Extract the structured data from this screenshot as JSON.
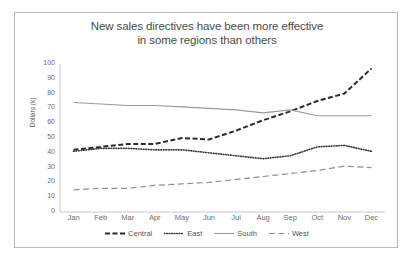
{
  "chart_data": {
    "type": "line",
    "title": "New sales directives have been more effective in some regions than others",
    "title_line1": "New sales directives have been more effective",
    "title_line2": "in some regions than others",
    "xlabel": "",
    "ylabel": "Dollars (k)",
    "ylim": [
      0,
      100
    ],
    "ytick_step": 10,
    "yticks": [
      "100",
      "90",
      "80",
      "70",
      "60",
      "50",
      "40",
      "30",
      "20",
      "10",
      "0"
    ],
    "categories": [
      "Jan",
      "Feb",
      "Mar",
      "Apr",
      "May",
      "Jun",
      "Jul",
      "Aug",
      "Sep",
      "Oct",
      "Nov",
      "Dec"
    ],
    "grid": false,
    "legend_position": "bottom",
    "series": [
      {
        "name": "Central",
        "style": "dashed",
        "color": "#2b2b2b",
        "values": [
          42,
          44,
          46,
          46,
          50,
          49,
          55,
          62,
          68,
          75,
          80,
          97
        ]
      },
      {
        "name": "East",
        "style": "dotted",
        "color": "#3a3a3a",
        "values": [
          41,
          43,
          43,
          42,
          42,
          40,
          38,
          36,
          38,
          44,
          45,
          41
        ]
      },
      {
        "name": "South",
        "style": "solid",
        "color": "#9a9a9a",
        "values": [
          74,
          73,
          72,
          72,
          71,
          70,
          69,
          67,
          69,
          65,
          65,
          65
        ]
      },
      {
        "name": "West",
        "style": "longdash",
        "color": "#8f8f8f",
        "values": [
          15,
          16,
          16,
          18,
          19,
          20,
          22,
          24,
          26,
          28,
          31,
          30
        ]
      }
    ]
  }
}
